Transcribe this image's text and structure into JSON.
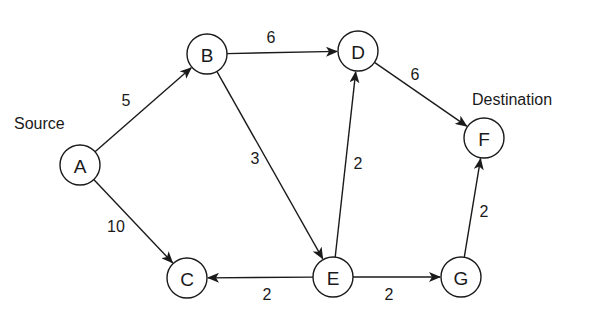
{
  "diagram": {
    "type": "directed-weighted-graph",
    "annotations": [
      {
        "id": "source",
        "text": "Source",
        "x": 14,
        "y": 123,
        "anchor": "start"
      },
      {
        "id": "destination",
        "text": "Destination",
        "x": 472,
        "y": 99,
        "anchor": "start"
      }
    ],
    "nodes": [
      {
        "id": "A",
        "label": "A",
        "x": 80,
        "y": 165
      },
      {
        "id": "B",
        "label": "B",
        "x": 207,
        "y": 54
      },
      {
        "id": "C",
        "label": "C",
        "x": 187,
        "y": 278
      },
      {
        "id": "D",
        "label": "D",
        "x": 358,
        "y": 51
      },
      {
        "id": "E",
        "label": "E",
        "x": 333,
        "y": 277
      },
      {
        "id": "F",
        "label": "F",
        "x": 484,
        "y": 138
      },
      {
        "id": "G",
        "label": "G",
        "x": 461,
        "y": 277
      }
    ],
    "edges": [
      {
        "from": "A",
        "to": "B",
        "weight": "5",
        "lx": 126,
        "ly": 100
      },
      {
        "from": "A",
        "to": "C",
        "weight": "10",
        "lx": 116,
        "ly": 226
      },
      {
        "from": "B",
        "to": "D",
        "weight": "6",
        "lx": 271,
        "ly": 37
      },
      {
        "from": "B",
        "to": "E",
        "weight": "3",
        "lx": 255,
        "ly": 158
      },
      {
        "from": "E",
        "to": "D",
        "weight": "2",
        "lx": 358,
        "ly": 163
      },
      {
        "from": "D",
        "to": "F",
        "weight": "6",
        "lx": 415,
        "ly": 74
      },
      {
        "from": "E",
        "to": "C",
        "weight": "2",
        "lx": 267,
        "ly": 294
      },
      {
        "from": "E",
        "to": "G",
        "weight": "2",
        "lx": 389,
        "ly": 294
      },
      {
        "from": "G",
        "to": "F",
        "weight": "2",
        "lx": 484,
        "ly": 211
      }
    ],
    "node_radius": 20,
    "colors": {
      "stroke": "#1a1a1a",
      "background": "#ffffff"
    }
  }
}
